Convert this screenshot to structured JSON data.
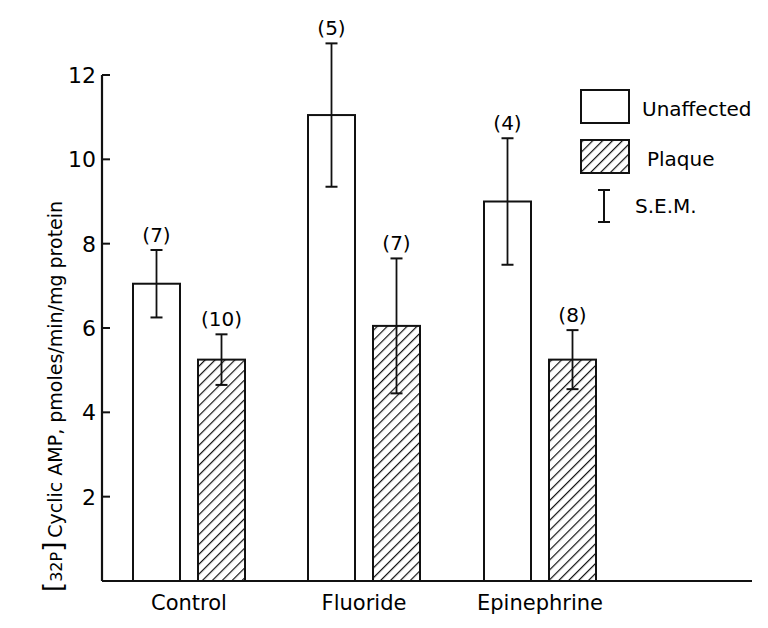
{
  "chart_data": {
    "type": "bar",
    "title": "",
    "xlabel": "",
    "ylabel": "Cyclic AMP, pmoles/min/mg protein",
    "ylabel_prefix": "32P",
    "ylim": [
      0,
      12
    ],
    "yticks": [
      2,
      4,
      6,
      8,
      10,
      12
    ],
    "grid": false,
    "legend_position": "upper right",
    "categories": [
      "Control",
      "Fluoride",
      "Epinephrine"
    ],
    "series": [
      {
        "name": "Unaffected",
        "fill": "open",
        "values": [
          7.05,
          11.05,
          9.0
        ],
        "sem": [
          0.8,
          1.7,
          1.5
        ],
        "n": [
          "(7)",
          "(5)",
          "(4)"
        ]
      },
      {
        "name": "Plaque",
        "fill": "hatched",
        "values": [
          5.25,
          6.05,
          5.25
        ],
        "sem": [
          0.6,
          1.6,
          0.7
        ],
        "n": [
          "(10)",
          "(7)",
          "(8)"
        ]
      }
    ],
    "error_bar_legend": "S.E.M."
  },
  "legend": {
    "items": [
      {
        "label": "Unaffected",
        "swatch": "open"
      },
      {
        "label": "Plaque",
        "swatch": "hatched"
      },
      {
        "label": "S.E.M.",
        "swatch": "error-bar"
      }
    ]
  },
  "colors": {
    "ink": "#111111",
    "background": "#ffffff"
  }
}
